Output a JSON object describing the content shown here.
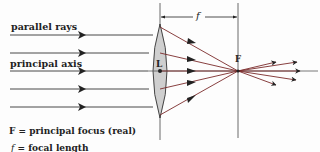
{
  "labels": {
    "parallel_rays": "parallel rays",
    "principal_axis": "principal axis",
    "lens_center": "L",
    "focus": "F",
    "focal_length_symbol": "f"
  },
  "legend": {
    "line1": "F = principal focus (real)",
    "line2_symbol": "f",
    "line2_text": " = focal length"
  },
  "colors": {
    "incident_ray": "#333333",
    "refracted_ray": "#7a2a2a",
    "lens_fill": "#cfcfcf",
    "lens_stroke": "#333333",
    "construction_line": "#444444"
  }
}
